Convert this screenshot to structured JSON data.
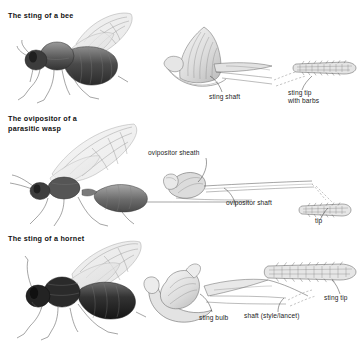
{
  "figure": {
    "kind": "scientific-illustration",
    "background_color": "#ffffff",
    "ink_color": "#3a3a3a",
    "panel_count": 3
  },
  "panels": [
    {
      "id": "bee",
      "title": "The sting of a bee",
      "insect_label": "honey bee lateral habitus",
      "callouts": [
        {
          "id": "sting-shaft",
          "text": "sting shaft"
        },
        {
          "id": "sting-tip",
          "text": "sting tip\nwith barbs"
        }
      ]
    },
    {
      "id": "wasp",
      "title": "The ovipositor of a\nparasitic wasp",
      "insect_label": "parasitic wasp lateral habitus",
      "callouts": [
        {
          "id": "ovipositor-sheath",
          "text": "ovipositor sheath"
        },
        {
          "id": "ovipositor-shaft",
          "text": "ovipositor shaft"
        },
        {
          "id": "tip",
          "text": "tip"
        }
      ]
    },
    {
      "id": "hornet",
      "title": "The sting of a hornet",
      "insect_label": "hornet lateral habitus",
      "callouts": [
        {
          "id": "sting-bulb",
          "text": "sting bulb"
        },
        {
          "id": "shaft",
          "text": "shaft (style/lancet)"
        },
        {
          "id": "sting-tip",
          "text": "sting tip"
        }
      ]
    }
  ]
}
